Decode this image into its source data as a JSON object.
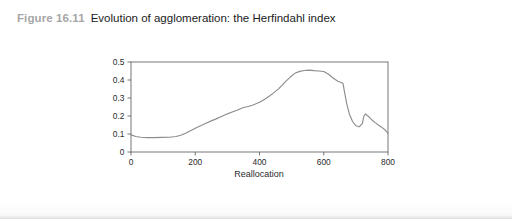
{
  "figure": {
    "number_label": "Figure 16.11",
    "title": "Evolution of agglomeration: the Herfindahl index"
  },
  "colors": {
    "caption_number": "#a6a6a6",
    "caption_title": "#1c1c1c",
    "line": "#8d8d8d",
    "axis": "#555555",
    "background": "#ffffff"
  },
  "chart_data": {
    "type": "line",
    "title": "",
    "xlabel": "Reallocation",
    "ylabel": "",
    "xlim": [
      0,
      800
    ],
    "ylim": [
      0,
      0.5
    ],
    "xticks": [
      0,
      200,
      400,
      600,
      800
    ],
    "xtick_labels": [
      "0",
      "200",
      "400",
      "600",
      "800"
    ],
    "yticks": [
      0,
      0.1,
      0.2,
      0.3,
      0.4,
      0.5
    ],
    "ytick_labels": [
      "0",
      "0.1",
      "0.2",
      "0.3",
      "0.4",
      "0.5"
    ],
    "grid": false,
    "legend": false,
    "series": [
      {
        "name": "Herfindahl index",
        "x": [
          0,
          15,
          30,
          50,
          70,
          95,
          120,
          140,
          155,
          170,
          185,
          200,
          215,
          230,
          250,
          265,
          280,
          300,
          315,
          330,
          350,
          365,
          380,
          400,
          415,
          430,
          445,
          460,
          470,
          480,
          495,
          510,
          525,
          540,
          555,
          570,
          585,
          600,
          615,
          630,
          645,
          655,
          660,
          665,
          672,
          680,
          690,
          700,
          710,
          720,
          725,
          730,
          740,
          750,
          760,
          770,
          780,
          790,
          800
        ],
        "y": [
          0.095,
          0.086,
          0.082,
          0.08,
          0.08,
          0.081,
          0.082,
          0.086,
          0.093,
          0.104,
          0.118,
          0.132,
          0.145,
          0.157,
          0.173,
          0.184,
          0.196,
          0.212,
          0.222,
          0.232,
          0.247,
          0.253,
          0.261,
          0.276,
          0.292,
          0.31,
          0.33,
          0.352,
          0.37,
          0.39,
          0.415,
          0.437,
          0.448,
          0.453,
          0.455,
          0.452,
          0.45,
          0.447,
          0.432,
          0.41,
          0.392,
          0.386,
          0.38,
          0.33,
          0.265,
          0.21,
          0.168,
          0.146,
          0.14,
          0.158,
          0.2,
          0.212,
          0.196,
          0.178,
          0.163,
          0.15,
          0.138,
          0.124,
          0.103
        ]
      }
    ]
  }
}
